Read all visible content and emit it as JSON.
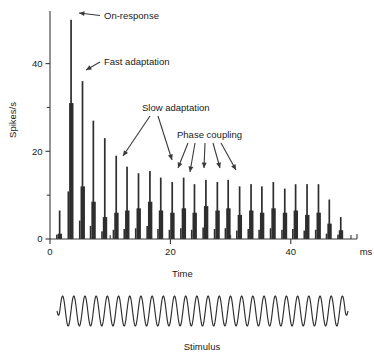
{
  "figure": {
    "name": "peristimulus-time-histogram",
    "y_axis": {
      "label": "Spikes/s",
      "ticks": [
        0,
        20,
        40
      ],
      "minor_ticks": [
        10,
        30
      ],
      "range": [
        0,
        52
      ]
    },
    "x_axis": {
      "label": "Time",
      "unit": "ms",
      "ticks": [
        0,
        20,
        40
      ],
      "minor_ticks": [
        10,
        30,
        50
      ],
      "range": [
        0,
        51
      ]
    },
    "annotations": [
      {
        "id": "on-response",
        "label": "On-response",
        "arrows": 1
      },
      {
        "id": "fast-adaptation",
        "label": "Fast adaptation",
        "arrows": 1
      },
      {
        "id": "slow-adaptation",
        "label": "Slow adaptation",
        "arrows": 2
      },
      {
        "id": "phase-coupling",
        "label": "Phase coupling",
        "arrows": 5
      }
    ],
    "stimulus": {
      "label": "Stimulus",
      "type": "sinusoid",
      "cycles": 26
    }
  },
  "chart_data": {
    "type": "bar",
    "title": "",
    "xlabel": "Time",
    "ylabel": "Spikes/s",
    "xunit": "ms",
    "xlim": [
      0,
      51
    ],
    "ylim": [
      0,
      52
    ],
    "grid": false,
    "legend": null,
    "bin_width_ms": 0.2,
    "cycle_period_ms": 1.85,
    "peaks": [
      {
        "t": 1.6,
        "peak": 6.5,
        "shoulder": 1.2
      },
      {
        "t": 3.5,
        "peak": 50.0,
        "shoulder": 31.0
      },
      {
        "t": 5.4,
        "peak": 36.0,
        "shoulder": 12.0
      },
      {
        "t": 7.2,
        "peak": 27.0,
        "shoulder": 8.5
      },
      {
        "t": 9.1,
        "peak": 23.0,
        "shoulder": 5.0
      },
      {
        "t": 11.0,
        "peak": 19.0,
        "shoulder": 6.0
      },
      {
        "t": 12.8,
        "peak": 16.5,
        "shoulder": 6.5
      },
      {
        "t": 14.7,
        "peak": 15.0,
        "shoulder": 7.0
      },
      {
        "t": 16.6,
        "peak": 15.5,
        "shoulder": 8.5
      },
      {
        "t": 18.4,
        "peak": 14.0,
        "shoulder": 6.5
      },
      {
        "t": 20.3,
        "peak": 13.0,
        "shoulder": 6.0
      },
      {
        "t": 22.2,
        "peak": 14.0,
        "shoulder": 7.0
      },
      {
        "t": 24.0,
        "peak": 12.5,
        "shoulder": 6.0
      },
      {
        "t": 25.9,
        "peak": 13.5,
        "shoulder": 7.5
      },
      {
        "t": 27.8,
        "peak": 13.0,
        "shoulder": 6.5
      },
      {
        "t": 29.6,
        "peak": 13.5,
        "shoulder": 7.0
      },
      {
        "t": 31.5,
        "peak": 12.0,
        "shoulder": 5.5
      },
      {
        "t": 33.4,
        "peak": 12.5,
        "shoulder": 6.5
      },
      {
        "t": 35.2,
        "peak": 12.0,
        "shoulder": 6.0
      },
      {
        "t": 37.1,
        "peak": 13.0,
        "shoulder": 7.0
      },
      {
        "t": 39.0,
        "peak": 11.5,
        "shoulder": 6.0
      },
      {
        "t": 40.8,
        "peak": 12.5,
        "shoulder": 6.5
      },
      {
        "t": 42.7,
        "peak": 12.5,
        "shoulder": 5.5
      },
      {
        "t": 44.6,
        "peak": 12.5,
        "shoulder": 6.0
      },
      {
        "t": 46.4,
        "peak": 9.0,
        "shoulder": 3.5
      },
      {
        "t": 48.3,
        "peak": 5.0,
        "shoulder": 2.0
      }
    ]
  }
}
